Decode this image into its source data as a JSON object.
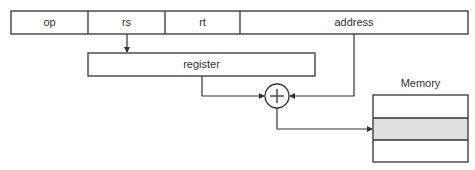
{
  "diagram": {
    "instruction_fields": [
      {
        "label": "op"
      },
      {
        "label": "rs"
      },
      {
        "label": "rt"
      },
      {
        "label": "address"
      }
    ],
    "register_label": "register",
    "adder_symbol": "+",
    "memory_label": "Memory",
    "memory_rows": 3,
    "highlighted_row": 1,
    "colors": {
      "line": "#333333",
      "text": "#333333",
      "highlight": "#e0e0e0",
      "background": "#ffffff"
    }
  }
}
